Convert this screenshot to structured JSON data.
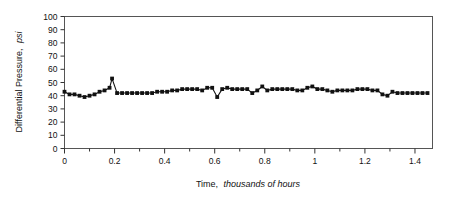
{
  "chart_data": {
    "type": "line",
    "title": "",
    "xlabel_parts": {
      "lead": "Time,",
      "emphasis": "thousands of hours"
    },
    "ylabel_parts": {
      "lead": "Differential Pressure,",
      "emphasis": "psi"
    },
    "xlabel": "Time, thousands of hours",
    "ylabel": "Differential Pressure, psi",
    "xlim": [
      0,
      1.47
    ],
    "ylim": [
      0,
      100
    ],
    "x_major_ticks": [
      0,
      0.2,
      0.4,
      0.6,
      0.8,
      1,
      1.2,
      1.4
    ],
    "x_major_tick_labels": [
      "0",
      "0.2",
      "0.4",
      "0.6",
      "0.8",
      "1",
      "1.2",
      "1.4"
    ],
    "x_minor_tick_step": 0.1,
    "y_ticks": [
      0,
      10,
      20,
      30,
      40,
      50,
      60,
      70,
      80,
      90,
      100
    ],
    "y_tick_labels": [
      "0",
      "10",
      "20",
      "30",
      "40",
      "50",
      "60",
      "70",
      "80",
      "90",
      "100"
    ],
    "grid": false,
    "legend": "none",
    "marker": "square",
    "marker_color": "#111111",
    "line_color": "#111111",
    "series": [
      {
        "name": "Differential Pressure",
        "x": [
          0.0,
          0.02,
          0.04,
          0.06,
          0.08,
          0.1,
          0.12,
          0.14,
          0.16,
          0.18,
          0.19,
          0.21,
          0.23,
          0.25,
          0.27,
          0.29,
          0.31,
          0.33,
          0.35,
          0.37,
          0.39,
          0.41,
          0.43,
          0.45,
          0.47,
          0.49,
          0.51,
          0.53,
          0.55,
          0.57,
          0.59,
          0.61,
          0.63,
          0.65,
          0.67,
          0.69,
          0.71,
          0.73,
          0.75,
          0.77,
          0.79,
          0.81,
          0.83,
          0.85,
          0.87,
          0.89,
          0.91,
          0.93,
          0.95,
          0.97,
          0.99,
          1.01,
          1.03,
          1.05,
          1.07,
          1.09,
          1.11,
          1.13,
          1.15,
          1.17,
          1.19,
          1.21,
          1.23,
          1.25,
          1.27,
          1.29,
          1.31,
          1.33,
          1.35,
          1.37,
          1.39,
          1.41,
          1.43,
          1.45
        ],
        "values": [
          43,
          41,
          41,
          40,
          39,
          40,
          41,
          43,
          44,
          46,
          53,
          42,
          42,
          42,
          42,
          42,
          42,
          42,
          42,
          43,
          43,
          43,
          44,
          44,
          45,
          45,
          45,
          45,
          44,
          46,
          46,
          39,
          45,
          46,
          45,
          45,
          45,
          45,
          42,
          44,
          47,
          44,
          45,
          45,
          45,
          45,
          45,
          44,
          44,
          46,
          47,
          45,
          45,
          44,
          43,
          44,
          44,
          44,
          44,
          45,
          45,
          45,
          44,
          44,
          41,
          40,
          43,
          42,
          42,
          42,
          42,
          42,
          42,
          42
        ]
      }
    ]
  },
  "icons": {
    "marker": "square-marker"
  }
}
